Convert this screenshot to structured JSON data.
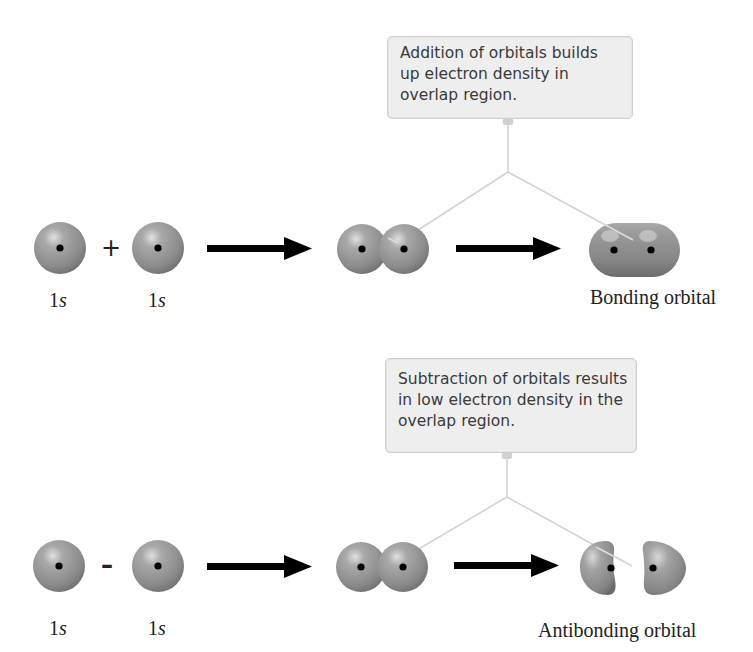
{
  "bonding": {
    "callout_lines": [
      "Addition of orbitals builds",
      "up electron density in",
      "overlap region."
    ],
    "operator": "+",
    "atom_labels": [
      {
        "num": "1",
        "sub": "s"
      },
      {
        "num": "1",
        "sub": "s"
      }
    ],
    "result_label": "Bonding orbital"
  },
  "antibonding": {
    "callout_lines": [
      "Subtraction of orbitals results",
      "in low electron density in the",
      "overlap region."
    ],
    "operator": "–",
    "atom_labels": [
      {
        "num": "1",
        "sub": "s"
      },
      {
        "num": "1",
        "sub": "s"
      }
    ],
    "result_label": "Antibonding orbital"
  },
  "colors": {
    "sphere_base": "#8f8f8f",
    "sphere_highlight": "#d9d9d9",
    "nucleus": "#000000",
    "arrow": "#000000",
    "connector": "#d4d4d4",
    "callout_bg": "#eeeeee"
  }
}
